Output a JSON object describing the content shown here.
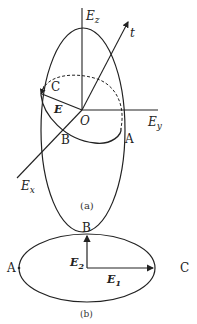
{
  "figure_a": {
    "caption": "(a)",
    "axes": {
      "z": {
        "label": "E",
        "sub": "z"
      },
      "y": {
        "label": "E",
        "sub": "y"
      },
      "x": {
        "label": "E",
        "sub": "x"
      },
      "t": {
        "label": "t"
      }
    },
    "origin_label": "O",
    "vector_label": "E",
    "points": {
      "A": "A",
      "B": "B",
      "C": "C"
    }
  },
  "figure_b": {
    "caption": "(b)",
    "points": {
      "A": "A",
      "B": "B",
      "C": "C"
    },
    "vectors": {
      "e1": {
        "label": "E",
        "sub": "1"
      },
      "e2": {
        "label": "E",
        "sub": "2"
      }
    }
  },
  "colors": {
    "stroke": "#222222",
    "background": "#ffffff"
  }
}
